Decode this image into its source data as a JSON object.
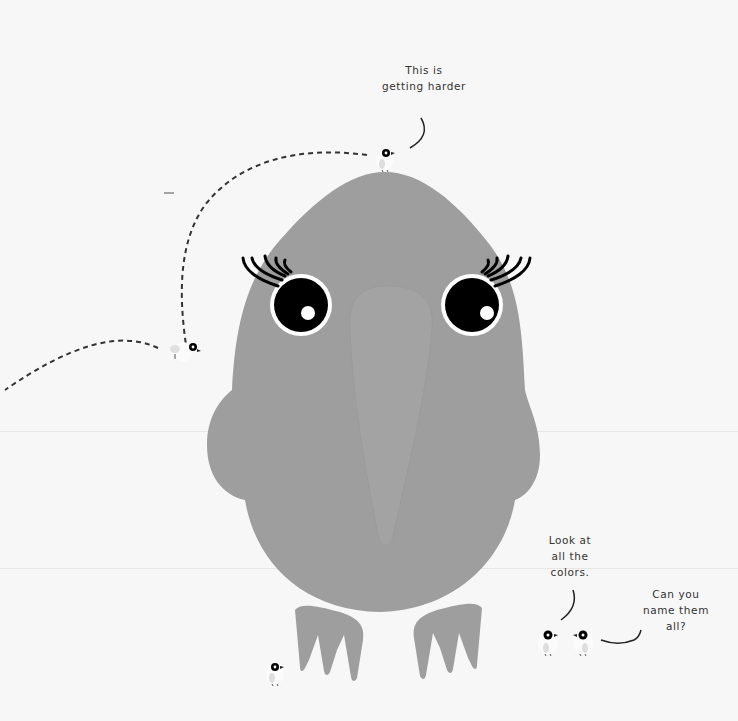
{
  "scene": {
    "background_color": "#f7f7f7",
    "bird_body_color": "#9e9e9e",
    "beak_color": "#a3a3a3",
    "eye_color": "#000000",
    "eye_ring_color": "#ffffff"
  },
  "captions": {
    "top": "This is\ngetting harder",
    "look": "Look at\nall the\ncolors.",
    "name": "Can you\nname them\nall?"
  },
  "characters": {
    "big_bird": "big-bird",
    "small_birds": [
      "small-bird-top",
      "small-bird-flying",
      "small-bird-ground",
      "small-bird-pair-left",
      "small-bird-pair-right"
    ]
  }
}
